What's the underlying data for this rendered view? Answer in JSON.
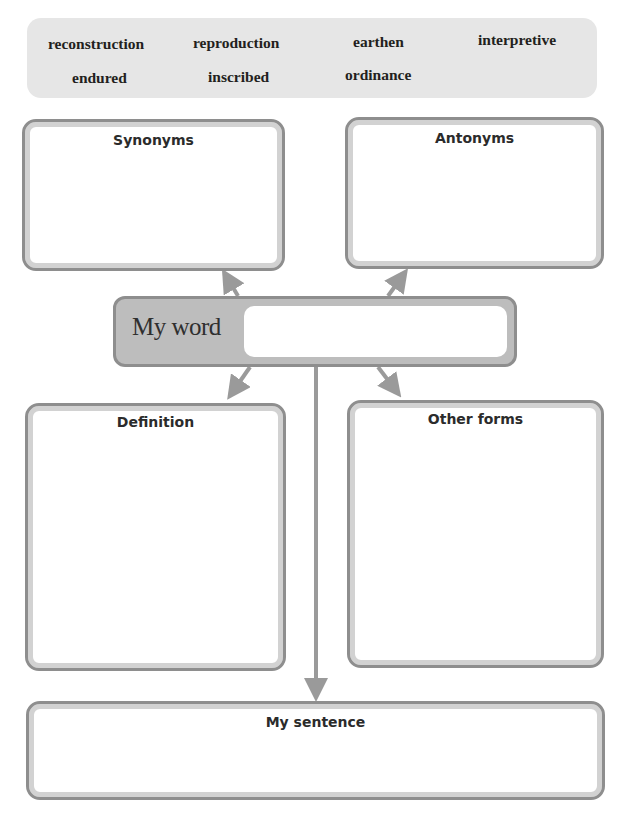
{
  "word_bank": {
    "words": [
      "reconstruction",
      "reproduction",
      "earthen",
      "interpretive",
      "endured",
      "inscribed",
      "ordinance"
    ]
  },
  "organizer": {
    "synonyms": {
      "title": "Synonyms",
      "value": ""
    },
    "antonyms": {
      "title": "Antonyms",
      "value": ""
    },
    "my_word": {
      "label": "My word",
      "value": ""
    },
    "definition": {
      "title": "Definition",
      "value": ""
    },
    "other_forms": {
      "title": "Other forms",
      "value": ""
    },
    "my_sentence": {
      "title": "My sentence",
      "value": ""
    }
  },
  "colors": {
    "word_bank_bg": "#e6e6e6",
    "box_border": "#8e8e8e",
    "box_rim": "#d2d2d2",
    "my_word_bg": "#bdbdbd",
    "arrow": "#9a9a9a",
    "text": "#2b2b2b"
  }
}
